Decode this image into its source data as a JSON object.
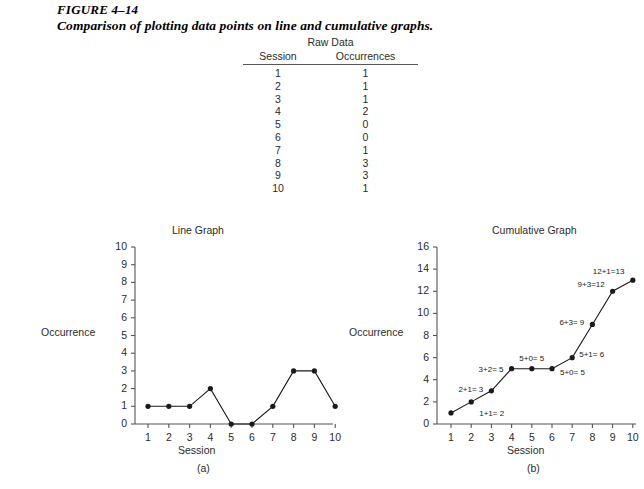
{
  "figure": {
    "number": "FIGURE 4–14",
    "caption": "Comparison of plotting data points on line and cumulative graphs."
  },
  "raw_data": {
    "title": "Raw Data",
    "columns": [
      "Session",
      "Occurrences"
    ],
    "rows": [
      [
        "1",
        "1"
      ],
      [
        "2",
        "1"
      ],
      [
        "3",
        "1"
      ],
      [
        "4",
        "2"
      ],
      [
        "5",
        "0"
      ],
      [
        "6",
        "0"
      ],
      [
        "7",
        "1"
      ],
      [
        "8",
        "3"
      ],
      [
        "9",
        "3"
      ],
      [
        "10",
        "1"
      ]
    ]
  },
  "chart_data": [
    {
      "type": "line",
      "title": "Line Graph",
      "panel": "(a)",
      "xlabel": "Session",
      "ylabel": "Occurrence",
      "x": [
        1,
        2,
        3,
        4,
        5,
        6,
        7,
        8,
        9,
        10
      ],
      "values": [
        1,
        1,
        1,
        2,
        0,
        0,
        1,
        3,
        3,
        1
      ],
      "xticks": [
        "1",
        "2",
        "3",
        "4",
        "5",
        "6",
        "7",
        "8",
        "9",
        "10"
      ],
      "yticks": [
        "0",
        "1",
        "2",
        "3",
        "4",
        "5",
        "6",
        "7",
        "8",
        "9",
        "10"
      ],
      "xlim": [
        1,
        10
      ],
      "ylim": [
        0,
        10
      ],
      "grid": false,
      "legend": false,
      "markers": "filled-circle"
    },
    {
      "type": "line",
      "title": "Cumulative Graph",
      "panel": "(b)",
      "xlabel": "Session",
      "ylabel": "Occurrence",
      "x": [
        1,
        2,
        3,
        4,
        5,
        6,
        7,
        8,
        9,
        10
      ],
      "values": [
        1,
        2,
        3,
        5,
        5,
        5,
        6,
        9,
        12,
        13
      ],
      "xticks": [
        "1",
        "2",
        "3",
        "4",
        "5",
        "6",
        "7",
        "8",
        "9",
        "10"
      ],
      "yticks": [
        "0",
        "2",
        "4",
        "6",
        "8",
        "10",
        "12",
        "14",
        "16"
      ],
      "xlim": [
        1,
        10
      ],
      "ylim": [
        0,
        16
      ],
      "grid": false,
      "legend": false,
      "markers": "filled-circle",
      "annotations": [
        {
          "text": "1+1= 2",
          "point": 2,
          "dx": 8,
          "dy": 12,
          "align": "left"
        },
        {
          "text": "2+1= 3",
          "point": 3,
          "dx": -8,
          "dy": -1,
          "align": "right"
        },
        {
          "text": "3+2= 5",
          "point": 4,
          "dx": -8,
          "dy": 1,
          "align": "right"
        },
        {
          "text": "5+0= 5",
          "point": 5,
          "dx": 0,
          "dy": -10,
          "align": "center"
        },
        {
          "text": "5+0= 5",
          "point": 6,
          "dx": 8,
          "dy": 4,
          "align": "left"
        },
        {
          "text": "5+1= 6",
          "point": 7,
          "dx": 7,
          "dy": -3,
          "align": "left"
        },
        {
          "text": "6+3= 9",
          "point": 8,
          "dx": -8,
          "dy": -1,
          "align": "right"
        },
        {
          "text": "9+3=12",
          "point": 9,
          "dx": -8,
          "dy": -6,
          "align": "right"
        },
        {
          "text": "12+1=13",
          "point": 10,
          "dx": -8,
          "dy": -8,
          "align": "right"
        }
      ]
    }
  ],
  "colors": {
    "ink": "#1a1a1a",
    "axis": "#555555",
    "text": "#2b2b2b",
    "background": "#ffffff"
  }
}
